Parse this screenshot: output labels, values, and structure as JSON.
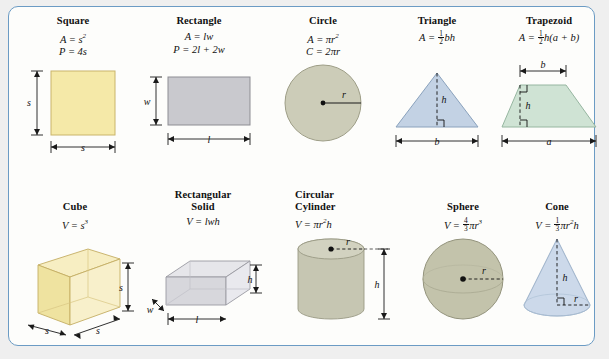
{
  "figures_plane": [
    {
      "name": "Square",
      "formulas": [
        "A = s²",
        "P = 4s"
      ],
      "labels": {
        "side_v": "s",
        "side_h": "s"
      },
      "fill": "#f5e9a8",
      "stroke": "#c9b46a"
    },
    {
      "name": "Rectangle",
      "formulas": [
        "A = lw",
        "P = 2l + 2w"
      ],
      "labels": {
        "width": "w",
        "length": "l"
      },
      "fill": "#c9c9ce",
      "stroke": "#8d8d93"
    },
    {
      "name": "Circle",
      "formulas": [
        "A = πr²",
        "C = 2πr"
      ],
      "labels": {
        "radius": "r"
      },
      "fill": "#ccccb8",
      "stroke": "#9d9d86"
    },
    {
      "name": "Triangle",
      "formulas": [
        "A = ½bh"
      ],
      "labels": {
        "height": "h",
        "base": "b"
      },
      "fill": "#c3d2e4",
      "stroke": "#8aa2bd"
    },
    {
      "name": "Trapezoid",
      "formulas": [
        "A = ½h(a + b)"
      ],
      "labels": {
        "top": "b",
        "height": "h",
        "bottom": "a"
      },
      "fill": "#cfe3d4",
      "stroke": "#96b6a0"
    }
  ],
  "figures_solid": [
    {
      "name": "Cube",
      "name_lines": [
        "Cube"
      ],
      "formulas": [
        "V = s³"
      ],
      "labels": {
        "height": "s",
        "depth": "s",
        "width": "s"
      },
      "fill": "#f3e7a5",
      "stroke": "#c4ae63"
    },
    {
      "name": "Rectangular Solid",
      "name_lines": [
        "Rectangular",
        "Solid"
      ],
      "formulas": [
        "V = lwh"
      ],
      "labels": {
        "width": "w",
        "length": "l",
        "height": "h"
      },
      "fill": "#d7d7dc",
      "stroke": "#9a9aa2"
    },
    {
      "name": "Circular Cylinder",
      "name_lines": [
        "Circular",
        "Cylinder"
      ],
      "formulas": [
        "V = πr²h"
      ],
      "labels": {
        "radius": "r",
        "height": "h"
      },
      "fill": "#c6c6b2",
      "stroke": "#9a9a84"
    },
    {
      "name": "Sphere",
      "name_lines": [
        "Sphere"
      ],
      "formulas": [
        "V = 4/3πr³"
      ],
      "labels": {
        "radius": "r"
      },
      "fill": "#c3c3ab",
      "stroke": "#93937c"
    },
    {
      "name": "Cone",
      "name_lines": [
        "Cone"
      ],
      "formulas": [
        "V = 1/3πr²h"
      ],
      "labels": {
        "height": "h",
        "radius": "r"
      },
      "fill": "#ccd9ea",
      "stroke": "#92a8c2"
    }
  ],
  "colors": {
    "border": "#6b9bc4",
    "page_background": "#efefef",
    "panel_background": "#fdfdfb",
    "text": "#111111",
    "dimension_line": "#1a1a1a"
  }
}
